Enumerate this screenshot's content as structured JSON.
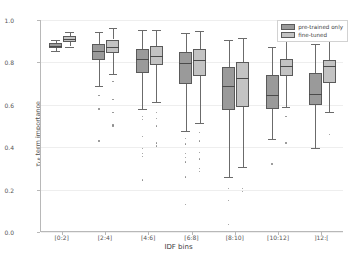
{
  "chart_data": {
    "type": "box",
    "title": "",
    "xlabel": "IDF bins",
    "ylabel_prefix": "τ",
    "ylabel_sub": "LP",
    "ylabel_suffix": " term importance",
    "ylim": [
      0.0,
      1.0
    ],
    "ytick_labels": [
      "0.0",
      "0.2",
      "0.4",
      "0.6",
      "0.8",
      "1.0"
    ],
    "ytick_values": [
      0.0,
      0.2,
      0.4,
      0.6,
      0.8,
      1.0
    ],
    "grid": true,
    "legend_position": "upper right",
    "categories": [
      "[0:2]",
      "[2:4]",
      "[4:6]",
      "[6:8]",
      "[8:10]",
      "[10:12]",
      "]12:["
    ],
    "series": [
      {
        "name": "pre-trained only",
        "color": "#9a9a9a",
        "boxes": [
          {
            "bin": "[0:2]",
            "whisker_low": 0.855,
            "q1": 0.868,
            "median": 0.879,
            "q3": 0.893,
            "whisker_high": 0.905,
            "fliers": []
          },
          {
            "bin": "[2:4]",
            "whisker_low": 0.69,
            "q1": 0.812,
            "median": 0.855,
            "q3": 0.885,
            "whisker_high": 0.945,
            "fliers": [
              0.645,
              0.58,
              0.43
            ]
          },
          {
            "bin": "[4:6]",
            "whisker_low": 0.58,
            "q1": 0.75,
            "median": 0.815,
            "q3": 0.865,
            "whisker_high": 0.955,
            "fliers": [
              0.545,
              0.53,
              0.45,
              0.395,
              0.37,
              0.355,
              0.245
            ]
          },
          {
            "bin": "[6:8]",
            "whisker_low": 0.475,
            "q1": 0.7,
            "median": 0.795,
            "q3": 0.85,
            "whisker_high": 0.94,
            "fliers": [
              0.44,
              0.415,
              0.37,
              0.35,
              0.33,
              0.26,
              0.13
            ]
          },
          {
            "bin": "[8:10]",
            "whisker_low": 0.26,
            "q1": 0.575,
            "median": 0.69,
            "q3": 0.78,
            "whisker_high": 0.905,
            "fliers": [
              0.205,
              0.15,
              0.035
            ]
          },
          {
            "bin": "[10:12]",
            "whisker_low": 0.44,
            "q1": 0.578,
            "median": 0.645,
            "q3": 0.74,
            "whisker_high": 0.875,
            "fliers": [
              0.32
            ]
          },
          {
            "bin": "]12:[",
            "whisker_low": 0.395,
            "q1": 0.6,
            "median": 0.65,
            "q3": 0.75,
            "whisker_high": 0.885,
            "fliers": []
          }
        ]
      },
      {
        "name": "fine-tuned",
        "color": "#c3c3c3",
        "boxes": [
          {
            "bin": "[0:2]",
            "whisker_low": 0.875,
            "q1": 0.895,
            "median": 0.91,
            "q3": 0.925,
            "whisker_high": 0.945,
            "fliers": []
          },
          {
            "bin": "[2:4]",
            "whisker_low": 0.745,
            "q1": 0.845,
            "median": 0.872,
            "q3": 0.908,
            "whisker_high": 0.96,
            "fliers": [
              0.71,
              0.625,
              0.565,
              0.505,
              0.5
            ]
          },
          {
            "bin": "[4:6]",
            "whisker_low": 0.615,
            "q1": 0.79,
            "median": 0.83,
            "q3": 0.878,
            "whisker_high": 0.955,
            "fliers": [
              0.565,
              0.535,
              0.5,
              0.42,
              0.405
            ]
          },
          {
            "bin": "[6:8]",
            "whisker_low": 0.515,
            "q1": 0.735,
            "median": 0.81,
            "q3": 0.865,
            "whisker_high": 0.95,
            "fliers": [
              0.47,
              0.43,
              0.375,
              0.345,
              0.3,
              0.285
            ]
          },
          {
            "bin": "[8:10]",
            "whisker_low": 0.305,
            "q1": 0.59,
            "median": 0.725,
            "q3": 0.8,
            "whisker_high": 0.915,
            "fliers": [
              0.205,
              0.19
            ]
          },
          {
            "bin": "[10:12]",
            "whisker_low": 0.59,
            "q1": 0.735,
            "median": 0.785,
            "q3": 0.815,
            "whisker_high": 0.9,
            "fliers": [
              0.545,
              0.42
            ]
          },
          {
            "bin": "]12:[",
            "whisker_low": 0.565,
            "q1": 0.705,
            "median": 0.785,
            "q3": 0.81,
            "whisker_high": 0.9,
            "fliers": [
              0.46
            ]
          }
        ]
      }
    ]
  },
  "legend": {
    "items": [
      {
        "label": "pre-trained only"
      },
      {
        "label": "fine-tuned"
      }
    ]
  },
  "colors": {
    "pre_trained": "#9a9a9a",
    "fine_tuned": "#c3c3c3",
    "edge": "#5a5a5a",
    "grid": "#eeeeee",
    "axis": "#b8b8b8"
  }
}
